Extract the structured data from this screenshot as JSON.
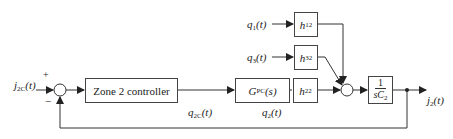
{
  "diagram": {
    "type": "block-diagram",
    "input_signal": {
      "name": "j",
      "sub": "2C",
      "arg": "(t)"
    },
    "sum1": {
      "plus_sign": "+",
      "minus_sign": "−"
    },
    "controller_block": {
      "label": "Zone 2 controller"
    },
    "controller_output": {
      "name": "q",
      "sub": "2C",
      "arg": "(t)"
    },
    "gpc_block": {
      "name": "G",
      "sub": "PC",
      "arg": "(s)"
    },
    "gpc_output": {
      "name": "q",
      "sub": "2",
      "arg": "(t)"
    },
    "h22_block": {
      "name": "h",
      "sub": "22"
    },
    "q1_input": {
      "name": "q",
      "sub": "1",
      "arg": "(t)"
    },
    "h12_block": {
      "name": "h",
      "sub": "12"
    },
    "q3_input": {
      "name": "q",
      "sub": "3",
      "arg": "(t)"
    },
    "h32_block": {
      "name": "h",
      "sub": "32"
    },
    "plant_block": {
      "numerator": "1",
      "denominator_s": "sC",
      "denominator_sub": "2"
    },
    "output_signal": {
      "name": "j",
      "sub": "2",
      "arg": "(t)"
    },
    "line_color": "#333333"
  }
}
